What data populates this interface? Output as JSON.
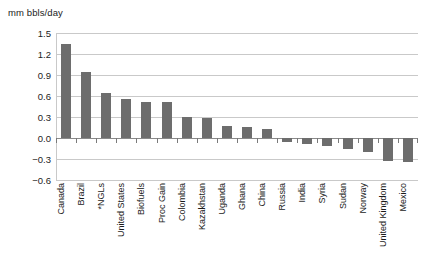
{
  "unit_label": "mm bbls/day",
  "chart_data": {
    "type": "bar",
    "title": "",
    "subtitle": "",
    "xlabel": "",
    "ylabel": "mm bbls/day",
    "ylim": [
      -0.6,
      1.5
    ],
    "ytick_values": [
      1.5,
      1.2,
      0.9,
      0.6,
      0.3,
      0.0,
      -0.3,
      -0.6
    ],
    "ytick_labels": [
      "1.5",
      "1.2",
      "0.9",
      "0.6",
      "0.3",
      "0.0",
      "−0.3",
      "−0.6"
    ],
    "grid": true,
    "legend": "none",
    "bar_color": "#6d6d6d",
    "gridline_color": "#c9c9c9",
    "categories": [
      "Canada",
      "Brazil",
      "*NGLs",
      "United States",
      "Biofuels",
      "Proc Gain",
      "Colombia",
      "Kazakhstan",
      "Uganda",
      "Ghana",
      "China",
      "Russia",
      "India",
      "Syria",
      "Sudan",
      "Norway",
      "United Kingdom",
      "Mexico"
    ],
    "values": [
      1.34,
      0.94,
      0.65,
      0.56,
      0.52,
      0.51,
      0.3,
      0.29,
      0.17,
      0.16,
      0.13,
      -0.05,
      -0.09,
      -0.12,
      -0.15,
      -0.2,
      -0.33,
      -0.34
    ],
    "footnote": "*NGLs"
  }
}
